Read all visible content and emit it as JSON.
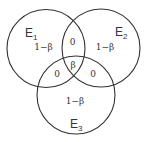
{
  "diagram": {
    "type": "venn",
    "stroke_color": "#333333",
    "background": "#ffffff",
    "sets": [
      {
        "name": "E",
        "subscript": "1"
      },
      {
        "name": "E",
        "subscript": "2"
      },
      {
        "name": "E",
        "subscript": "3"
      }
    ],
    "regions": {
      "only_e1": "1−β",
      "only_e2": "1−β",
      "only_e3": "1−β",
      "e1_e2": "0",
      "e1_e3": "0",
      "e2_e3": "0",
      "e1_e2_e3": "β"
    }
  }
}
